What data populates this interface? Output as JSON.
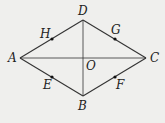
{
  "figure": {
    "type": "rhombus-diagram",
    "background": "#efefed",
    "stroke_color": "#333333",
    "points": {
      "A": {
        "x": 20,
        "y": 58,
        "label": "A",
        "lx": 8,
        "ly": 62
      },
      "B": {
        "x": 83,
        "y": 96,
        "label": "B",
        "lx": 78,
        "ly": 110
      },
      "C": {
        "x": 146,
        "y": 58,
        "label": "C",
        "lx": 150,
        "ly": 62
      },
      "D": {
        "x": 83,
        "y": 20,
        "label": "D",
        "lx": 78,
        "ly": 15
      },
      "O": {
        "x": 83,
        "y": 58,
        "label": "O",
        "lx": 86,
        "ly": 70
      },
      "H": {
        "x": 52,
        "y": 39,
        "label": "H",
        "lx": 40,
        "ly": 38
      },
      "G": {
        "x": 115,
        "y": 39,
        "label": "G",
        "lx": 111,
        "ly": 34
      },
      "E": {
        "x": 52,
        "y": 77,
        "label": "E",
        "lx": 43,
        "ly": 89
      },
      "F": {
        "x": 115,
        "y": 77,
        "label": "F",
        "lx": 116,
        "ly": 89
      }
    },
    "segments": [
      [
        "A",
        "D"
      ],
      [
        "D",
        "C"
      ],
      [
        "C",
        "B"
      ],
      [
        "B",
        "A"
      ],
      [
        "A",
        "C"
      ],
      [
        "D",
        "B"
      ]
    ],
    "marked_points": [
      "H",
      "G",
      "E",
      "F"
    ]
  }
}
